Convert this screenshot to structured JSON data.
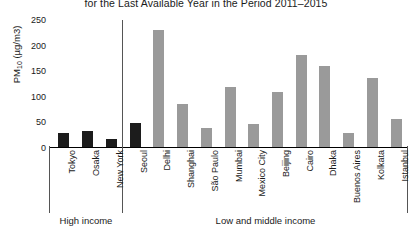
{
  "chart_data": {
    "type": "bar",
    "title": "for the Last Available Year in the Period 2011–2015",
    "xlabel": "",
    "ylabel": "PM10 (µg/m3)",
    "ylabel_main": "PM",
    "ylabel_sub": "10",
    "ylabel_unit": " (µg/m3)",
    "ylim": [
      0,
      250
    ],
    "yticks": [
      250,
      200,
      150,
      100,
      50,
      0
    ],
    "grid": false,
    "legend": "none",
    "categories": [
      "Tokyo",
      "Osaka",
      "New York",
      "Seoul",
      "Delhi",
      "Shanghai",
      "São Paulo",
      "Mumbai",
      "Mexico City",
      "Beijing",
      "Cairo",
      "Dhaka",
      "Buenos Aires",
      "Kolkata",
      "Istanbul"
    ],
    "values": [
      27,
      31,
      16,
      46,
      229,
      84,
      37,
      117,
      45,
      108,
      179,
      158,
      28,
      135,
      55
    ],
    "groups": [
      {
        "label": "High income",
        "color": "#1c1c1c",
        "categories": [
          "Tokyo",
          "Osaka",
          "New York",
          "Seoul"
        ]
      },
      {
        "label": "Low and middle income",
        "color": "#9a9a9a",
        "categories": [
          "Delhi",
          "Shanghai",
          "São Paulo",
          "Mumbai",
          "Mexico City",
          "Beijing",
          "Cairo",
          "Dhaka",
          "Buenos Aires",
          "Kolkata",
          "Istanbul"
        ]
      }
    ],
    "bars": [
      {
        "category": "Tokyo",
        "value": 27,
        "group": "High income"
      },
      {
        "category": "Osaka",
        "value": 31,
        "group": "High income"
      },
      {
        "category": "New York",
        "value": 16,
        "group": "High income"
      },
      {
        "category": "Seoul",
        "value": 46,
        "group": "High income"
      },
      {
        "category": "Delhi",
        "value": 229,
        "group": "Low and middle income"
      },
      {
        "category": "Shanghai",
        "value": 84,
        "group": "Low and middle income"
      },
      {
        "category": "São Paulo",
        "value": 37,
        "group": "Low and middle income"
      },
      {
        "category": "Mumbai",
        "value": 117,
        "group": "Low and middle income"
      },
      {
        "category": "Mexico City",
        "value": 45,
        "group": "Low and middle income"
      },
      {
        "category": "Beijing",
        "value": 108,
        "group": "Low and middle income"
      },
      {
        "category": "Cairo",
        "value": 179,
        "group": "Low and middle income"
      },
      {
        "category": "Dhaka",
        "value": 158,
        "group": "Low and middle income"
      },
      {
        "category": "Buenos Aires",
        "value": 28,
        "group": "Low and middle income"
      },
      {
        "category": "Kolkata",
        "value": 135,
        "group": "Low and middle income"
      },
      {
        "category": "Istanbul",
        "value": 55,
        "group": "Low and middle income"
      }
    ]
  }
}
